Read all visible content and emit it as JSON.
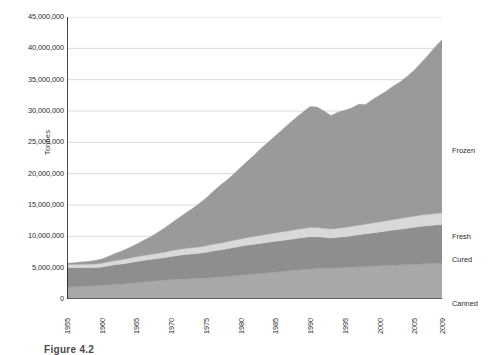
{
  "caption": "Figure 4.2",
  "chart_data": {
    "type": "area",
    "stacked": true,
    "title": "",
    "xlabel": "",
    "ylabel": "Tonnes",
    "xlim": [
      1955,
      2009
    ],
    "ylim": [
      0,
      45000000
    ],
    "grid": true,
    "legend_position": "right-inline",
    "ytick_labels": [
      "0",
      "5,000,000",
      "10,000,000",
      "15,000,000",
      "20,000,000",
      "25,000,000",
      "30,000,000",
      "35,000,000",
      "40,000,000",
      "45,000,000"
    ],
    "ytick_values": [
      0,
      5000000,
      10000000,
      15000000,
      20000000,
      25000000,
      30000000,
      35000000,
      40000000,
      45000000
    ],
    "xtick_labels": [
      "1955",
      "1960",
      "1965",
      "1970",
      "1975",
      "1980",
      "1985",
      "1990",
      "1995",
      "2000",
      "2005",
      "2009"
    ],
    "xtick_values": [
      1955,
      1960,
      1965,
      1970,
      1975,
      1980,
      1985,
      1990,
      1995,
      2000,
      2005,
      2009
    ],
    "x": [
      1955,
      1956,
      1957,
      1958,
      1959,
      1960,
      1961,
      1962,
      1963,
      1964,
      1965,
      1966,
      1967,
      1968,
      1969,
      1970,
      1971,
      1972,
      1973,
      1974,
      1975,
      1976,
      1977,
      1978,
      1979,
      1980,
      1981,
      1982,
      1983,
      1984,
      1985,
      1986,
      1987,
      1988,
      1989,
      1990,
      1991,
      1992,
      1993,
      1994,
      1995,
      1996,
      1997,
      1998,
      1999,
      2000,
      2001,
      2002,
      2003,
      2004,
      2005,
      2006,
      2007,
      2008,
      2009
    ],
    "series": [
      {
        "name": "Canned",
        "color": "#a8a8a8",
        "values": [
          1900000,
          1950000,
          2000000,
          2050000,
          2100000,
          2150000,
          2250000,
          2350000,
          2400000,
          2500000,
          2600000,
          2700000,
          2800000,
          2900000,
          3000000,
          3100000,
          3150000,
          3200000,
          3250000,
          3300000,
          3350000,
          3450000,
          3500000,
          3600000,
          3700000,
          3800000,
          3900000,
          4000000,
          4100000,
          4200000,
          4300000,
          4400000,
          4500000,
          4600000,
          4700000,
          4800000,
          4850000,
          4900000,
          4950000,
          5000000,
          5050000,
          5100000,
          5150000,
          5200000,
          5250000,
          5300000,
          5350000,
          5400000,
          5450000,
          5500000,
          5550000,
          5600000,
          5650000,
          5700000,
          5750000
        ]
      },
      {
        "name": "Cured",
        "color": "#8e8e8e",
        "values": [
          3100000,
          3050000,
          3000000,
          2950000,
          2900000,
          2950000,
          3050000,
          3150000,
          3200000,
          3300000,
          3400000,
          3450000,
          3500000,
          3550000,
          3600000,
          3700000,
          3800000,
          3900000,
          3950000,
          4000000,
          4100000,
          4200000,
          4300000,
          4400000,
          4500000,
          4600000,
          4700000,
          4750000,
          4800000,
          4850000,
          4900000,
          4950000,
          5000000,
          5050000,
          5100000,
          5150000,
          5100000,
          4950000,
          4800000,
          4850000,
          4900000,
          5000000,
          5100000,
          5200000,
          5300000,
          5400000,
          5500000,
          5600000,
          5700000,
          5800000,
          5900000,
          6000000,
          6050000,
          6100000,
          6150000
        ]
      },
      {
        "name": "Fresh",
        "color": "#d9d9d9",
        "values": [
          500000,
          520000,
          540000,
          560000,
          580000,
          600000,
          630000,
          660000,
          690000,
          720000,
          750000,
          780000,
          810000,
          840000,
          870000,
          900000,
          930000,
          960000,
          990000,
          1010000,
          1040000,
          1070000,
          1100000,
          1130000,
          1160000,
          1190000,
          1220000,
          1250000,
          1280000,
          1310000,
          1340000,
          1370000,
          1400000,
          1430000,
          1450000,
          1480000,
          1470000,
          1440000,
          1420000,
          1440000,
          1460000,
          1490000,
          1520000,
          1550000,
          1580000,
          1610000,
          1640000,
          1670000,
          1700000,
          1730000,
          1760000,
          1790000,
          1810000,
          1830000,
          1850000
        ]
      },
      {
        "name": "Frozen",
        "color": "#9a9a9a",
        "values": [
          200000,
          280000,
          360000,
          440000,
          560000,
          700000,
          900000,
          1150000,
          1400000,
          1700000,
          2000000,
          2400000,
          2800000,
          3300000,
          3800000,
          4400000,
          5000000,
          5600000,
          6200000,
          6900000,
          7600000,
          8400000,
          9200000,
          9800000,
          10600000,
          11400000,
          12200000,
          13000000,
          13900000,
          14700000,
          15500000,
          16300000,
          17100000,
          17900000,
          18600000,
          19300000,
          19200000,
          18700000,
          18100000,
          18500000,
          18700000,
          18900000,
          19300000,
          19100000,
          19700000,
          20200000,
          20700000,
          21300000,
          21800000,
          22500000,
          23300000,
          24300000,
          25400000,
          26600000,
          27600000
        ]
      }
    ],
    "series_label_positions": [
      {
        "name": "Frozen",
        "y": 150
      },
      {
        "name": "Fresh",
        "y": 236
      },
      {
        "name": "Cured",
        "y": 259
      },
      {
        "name": "Canned",
        "y": 303
      }
    ]
  }
}
